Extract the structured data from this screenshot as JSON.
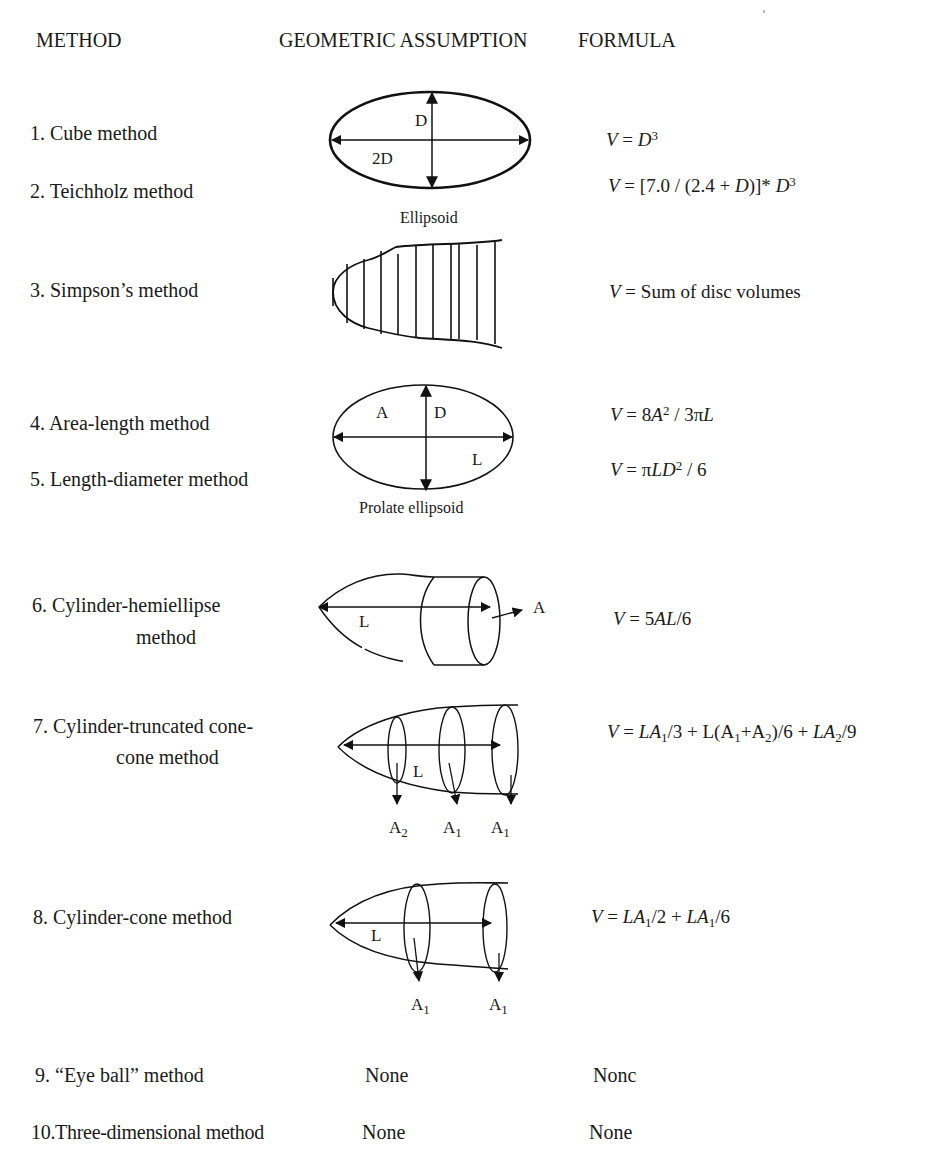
{
  "headers": {
    "method": "METHOD",
    "geometry": "GEOMETRIC ASSUMPTION",
    "formula": "FORMULA"
  },
  "methods": [
    {
      "label": "1. Cube method"
    },
    {
      "label": "2. Teichholz method"
    },
    {
      "label": "3. Simpson’s method"
    },
    {
      "label": "4. Area-length method"
    },
    {
      "label": "5. Length-diameter method"
    },
    {
      "label_line1": "6. Cylinder-hemiellipse",
      "label_line2": "method"
    },
    {
      "label_line1": "7. Cylinder-truncated cone-",
      "label_line2": "cone method"
    },
    {
      "label": "8. Cylinder-cone method"
    },
    {
      "label": "9. “Eye ball” method"
    },
    {
      "label": "10.Three-dimensional method"
    }
  ],
  "formulas": {
    "cube": {
      "v": "V",
      "eq": " = ",
      "base": "D",
      "exp": "3"
    },
    "teichholz": {
      "v": "V",
      "part1": " = [7.0 / (2.4 + ",
      "d": "D",
      "part2": ")]* ",
      "base": "D",
      "exp": "3"
    },
    "simpson": {
      "v": "V",
      "rest": " = Sum of disc volumes"
    },
    "area_length": {
      "v": "V",
      "eq": " = 8",
      "a": "A",
      "exp": "2",
      "mid": " / 3π",
      "l": "L"
    },
    "length_diameter": {
      "v": "V",
      "eq": " = π",
      "ld": "LD",
      "exp": "2",
      "tail": " / 6"
    },
    "cyl_hemi": {
      "v": "V",
      "eq": " = 5",
      "al": "AL",
      "tail": "/6"
    },
    "cyl_trunc": {
      "v": "V",
      "eq": " = ",
      "la1": "LA",
      "s1": "1",
      "t1": "/3 + L(A",
      "s2": "1",
      "t2": "+A",
      "s3": "2",
      "t3": ")/6 + ",
      "la2": "LA",
      "s4": "2",
      "t4": "/9"
    },
    "cyl_cone": {
      "v": "V",
      "eq": " = ",
      "la1": "LA",
      "s1": "1",
      "t1": "/2 + ",
      "la2": "LA",
      "s2": "1",
      "t2": "/6"
    },
    "eye_ball": "Nonc",
    "three_d": "None"
  },
  "geometry": {
    "ellipsoid": {
      "caption": "Ellipsoid",
      "label_d": "D",
      "label_2d": "2D"
    },
    "prolate": {
      "caption": "Prolate ellipsoid",
      "label_a": "A",
      "label_d": "D",
      "label_l": "L"
    },
    "cyl_hemi": {
      "label_l": "L",
      "label_a": "A"
    },
    "cyl_trunc": {
      "label_l": "L",
      "areas": [
        {
          "base": "A",
          "sub": "2"
        },
        {
          "base": "A",
          "sub": "1"
        },
        {
          "base": "A",
          "sub": "1"
        }
      ]
    },
    "cyl_cone": {
      "label_l": "L",
      "areas": [
        {
          "base": "A",
          "sub": "1"
        },
        {
          "base": "A",
          "sub": "1"
        }
      ]
    },
    "eye_ball": "None",
    "three_d": "None"
  }
}
